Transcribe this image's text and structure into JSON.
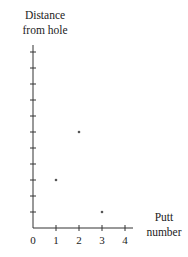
{
  "chart_data": {
    "type": "scatter",
    "title": "",
    "xlabel": "Putt number",
    "ylabel": "Distance from hole",
    "xlabel_lines": [
      "Putt",
      "number"
    ],
    "ylabel_lines": [
      "Distance",
      "from hole"
    ],
    "x_ticks": [
      0,
      1,
      2,
      3,
      4
    ],
    "y_tick_count": 11,
    "y_tick_labels": [],
    "xlim": [
      0,
      4.3
    ],
    "ylim": [
      0,
      11.5
    ],
    "grid": false,
    "legend": null,
    "points": [
      {
        "x": 1,
        "y": 3
      },
      {
        "x": 2,
        "y": 6
      },
      {
        "x": 3,
        "y": 1
      }
    ],
    "colors": {
      "axis": "#333333",
      "point": "#555555"
    }
  }
}
